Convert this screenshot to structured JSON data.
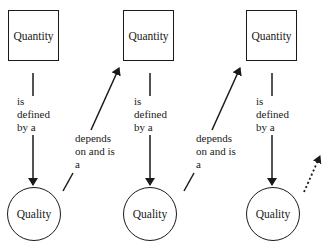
{
  "diagram": {
    "nodes": {
      "quantity_1": {
        "label": "Quantity",
        "shape": "square"
      },
      "quantity_2": {
        "label": "Quantity",
        "shape": "square"
      },
      "quantity_3": {
        "label": "Quantity",
        "shape": "square"
      },
      "quality_1": {
        "label": "Quality",
        "shape": "circle"
      },
      "quality_2": {
        "label": "Quality",
        "shape": "circle"
      },
      "quality_3": {
        "label": "Quality",
        "shape": "circle"
      }
    },
    "edges": {
      "defined_1": {
        "from": "quantity_1",
        "to": "quality_1",
        "label": "is\ndefined\nby a",
        "style": "solid"
      },
      "defined_2": {
        "from": "quantity_2",
        "to": "quality_2",
        "label": "is\ndefined\nby a",
        "style": "solid"
      },
      "defined_3": {
        "from": "quantity_3",
        "to": "quality_3",
        "label": "is\ndefined\nby a",
        "style": "solid"
      },
      "depends_1": {
        "from": "quality_1",
        "to": "quantity_2",
        "label": "depends\non and is\na",
        "style": "solid"
      },
      "depends_2": {
        "from": "quality_2",
        "to": "quantity_3",
        "label": "depends\non and is\na",
        "style": "solid"
      },
      "continues": {
        "from": "quality_3",
        "to": "",
        "label": "",
        "style": "dotted"
      }
    },
    "colors": {
      "stroke": "#1a1a1a",
      "background": "#ffffff"
    }
  }
}
